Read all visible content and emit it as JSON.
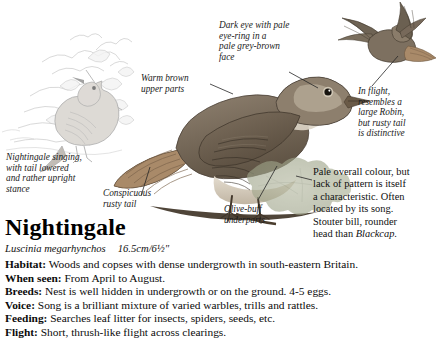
{
  "page": {
    "title": "Nightingale",
    "scientific_name": "Luscinia megarhynchos",
    "size": "16.5cm/6½\"",
    "background": "#ffffff"
  },
  "annotations": {
    "eye": "Dark eye with pale\neye-ring in a\npale grey-brown\nface",
    "upper_parts": "Warm brown\nupper parts",
    "in_flight": "In flight,\nresembles a\nlarge Robin,\nbut rusty tail\nis distinctive",
    "singing": "Nightingale singing,\nwith tail lowered\nand rather upright\nstance",
    "rusty_tail": "Conspicuous\nrusty tail",
    "underparts": "Olive-buff\nunderparts"
  },
  "description": {
    "line1": "Pale overall colour, but",
    "line2": "lack of pattern is itself",
    "line3": "a characteristic. Often",
    "line4": "located by its song.",
    "line5": "Stouter bill, rounder",
    "line6_pre": "head than ",
    "line6_italic": "Blackcap",
    "line6_post": "."
  },
  "facts": [
    {
      "label": "Habitat:",
      "text": " Woods and copses with dense undergrowth in south-eastern Britain."
    },
    {
      "label": "When seen:",
      "text": " From April to August."
    },
    {
      "label": "Breeds:",
      "text": " Nest is well hidden in undergrowth or on the ground. 4-5 eggs."
    },
    {
      "label": "Voice:",
      "text": " Song is a brilliant mixture of varied warbles, trills and rattles."
    },
    {
      "label": "Feeding:",
      "text": " Searches leaf litter for insects, spiders, seeds, etc."
    },
    {
      "label": "Flight:",
      "text": " Short, thrush-like flight across clearings."
    }
  ],
  "illustrations": {
    "sketch_singing": "nightingale-singing-sketch",
    "main_bird": "nightingale-perched-illustration",
    "flight_bird": "nightingale-in-flight-illustration",
    "foliage": "oak-leaves-illustration"
  },
  "colors": {
    "body_brown": "#8a7a68",
    "back_brown": "#6f6253",
    "rusty_tail": "#9a7a5e",
    "pale_underpart": "#d8cfc0",
    "leaf_green": "#a9ad94",
    "ink": "#101010",
    "sketch_grey": "#b6b6b6"
  }
}
